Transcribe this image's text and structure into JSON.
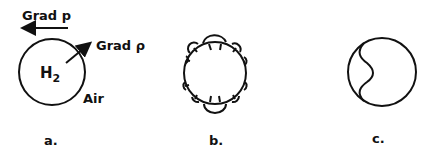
{
  "panels": [
    {
      "id": "a",
      "label": "a.",
      "bubble_label": "H",
      "bubble_subscript": "2",
      "surroundings_label": "Air",
      "pressure_gradient_label": "Grad p",
      "density_gradient_label": "Grad ρ"
    },
    {
      "id": "b",
      "label": "b."
    },
    {
      "id": "c",
      "label": "c."
    }
  ],
  "colors": {
    "stroke": "#111111",
    "background": "#ffffff"
  }
}
